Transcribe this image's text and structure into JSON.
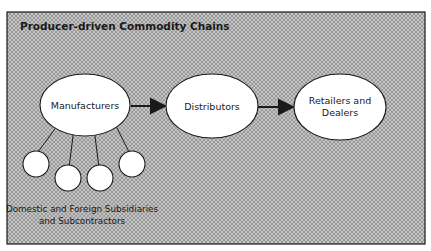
{
  "diagram": {
    "title": "Producer-driven Commodity Chains",
    "nodes": [
      {
        "id": "manufacturers",
        "label": "Manufacturers"
      },
      {
        "id": "distributors",
        "label": "Distributors"
      },
      {
        "id": "retailers",
        "label_line1": "Retailers and",
        "label_line2": "Dealers"
      }
    ],
    "edges": [
      {
        "from": "manufacturers",
        "to": "distributors"
      },
      {
        "from": "distributors",
        "to": "retailers"
      }
    ],
    "subsidiaries": {
      "count": 4,
      "caption_line1": "Domestic and Foreign Subsidiaries",
      "caption_line2": "and Subcontractors"
    },
    "colors": {
      "background_pattern": "#b8b8b8",
      "node_fill": "#ffffff",
      "stroke": "#1a1a1a"
    }
  }
}
